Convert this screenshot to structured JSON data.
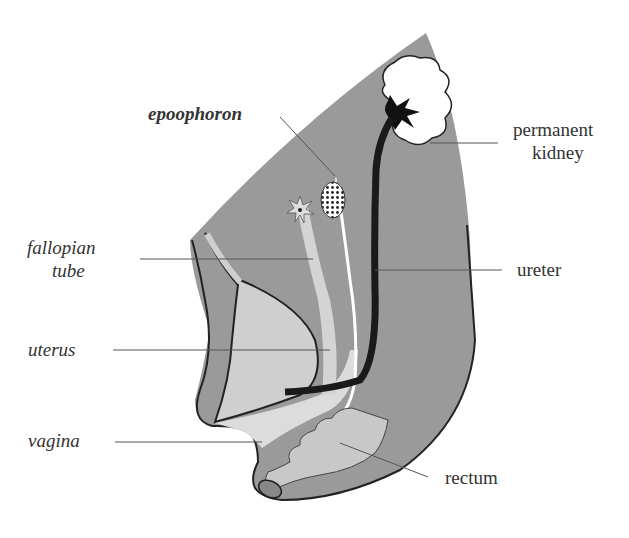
{
  "diagram": {
    "colors": {
      "body": "#9a9a9a",
      "outline": "#222222",
      "light": "#cfcfcf",
      "kidney": "#ffffff",
      "ureter": "#1a1a1a",
      "text": "#333333"
    },
    "labels": {
      "epoophoron": "epoophoron",
      "permanent_kidney_line1": "permanent",
      "permanent_kidney_line2": "kidney",
      "fallopian_tube_line1": "fallopian",
      "fallopian_tube_line2": "tube",
      "ureter": "ureter",
      "uterus": "uterus",
      "vagina": "vagina",
      "rectum": "rectum"
    }
  }
}
